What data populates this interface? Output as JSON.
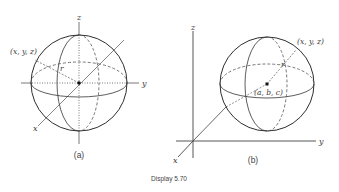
{
  "figure": {
    "caption": "Display 5.70",
    "panels": [
      {
        "id": "a",
        "label": "(a)",
        "axis_labels": {
          "x": "x",
          "y": "y",
          "z": "z"
        },
        "point_label": "(x, y, z)",
        "radius_label": "r",
        "description": "Sphere of radius r centered at the origin"
      },
      {
        "id": "b",
        "label": "(b)",
        "axis_labels": {
          "x": "x",
          "y": "y",
          "z": "z"
        },
        "point_label": "(x, y, z)",
        "center_label": "(a, b, c)",
        "radius_label": "r",
        "description": "Sphere of radius r centered at (a, b, c)"
      }
    ]
  },
  "colors": {
    "line": "#3a3a3a",
    "sphere_outline": "#2e2e2e",
    "dashed": "#555555"
  }
}
